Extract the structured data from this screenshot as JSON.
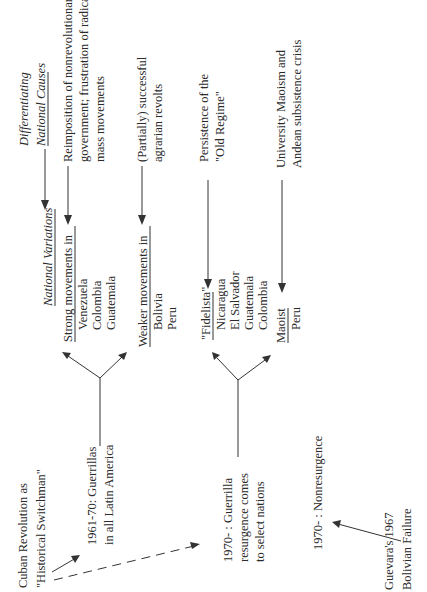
{
  "origin": {
    "title_line1": "Cuban Revolution as",
    "title_line2": "\"Historical Switchman\""
  },
  "period_1961": {
    "line1": "1961-70: Guerrillas",
    "line2": "in all Latin America"
  },
  "period_1970_resurgence": {
    "line1": "1970- : Guerrilla",
    "line2": "resurgence comes",
    "line3": "to select nations"
  },
  "period_1970_nonresurgence": {
    "line1": "1970- : Nonresurgence"
  },
  "guevara": {
    "line1": "Guevara's 1967",
    "line2": "Bolivian Failure"
  },
  "headers": {
    "national_variations": "National Variations",
    "differentiating_line1": "Differentiating",
    "differentiating_line2": "National Causes"
  },
  "variations": {
    "strong": {
      "label": "Strong movements in",
      "countries": [
        "Venezuela",
        "Colombia",
        "Guatemala"
      ]
    },
    "weaker": {
      "label": "Weaker movements in",
      "countries": [
        "Bolivia",
        "Peru"
      ]
    },
    "fidelista": {
      "label": "\"Fidelista\"",
      "countries": [
        "Nicaragua",
        "El Salvador",
        "Guatemala",
        "Colombia"
      ]
    },
    "maoist": {
      "label": "Maoist",
      "countries": [
        "Peru"
      ]
    }
  },
  "causes": {
    "strong": [
      "Reimposition of nonrevolutionary",
      "government; frustration of radical",
      "mass movements"
    ],
    "weaker": [
      "(Partially) successful",
      "agrarian revolts"
    ],
    "fidelista": [
      "Persistence of the",
      "\"Old Regime\""
    ],
    "maoist": [
      "University Maoism and",
      "Andean subsistence crisis"
    ]
  }
}
